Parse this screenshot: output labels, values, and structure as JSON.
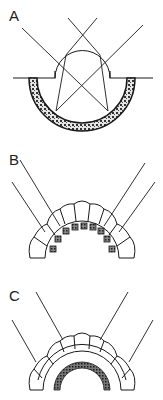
{
  "figure": {
    "panels": [
      {
        "label": "A",
        "description": "Simple eye: lens over cup-shaped retina, crossing light rays"
      },
      {
        "label": "B",
        "description": "Apposition compound eye: ommatidia with pigment-isolated receptors"
      },
      {
        "label": "C",
        "description": "Superposition compound eye: ommatidia with clear zone above retina"
      }
    ]
  },
  "colors": {
    "stroke": "#1a1a1a",
    "fill_pattern": "#555555",
    "background": "#ffffff"
  }
}
